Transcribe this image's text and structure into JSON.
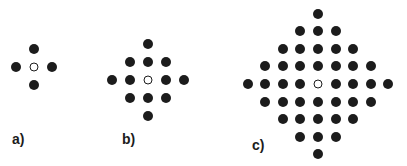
{
  "figure": {
    "panels": [
      {
        "id": "a",
        "label": "a)",
        "center": [
          34,
          67
        ],
        "spacing": 18,
        "radius": 1,
        "label_pos": [
          12,
          131
        ]
      },
      {
        "id": "b",
        "label": "b)",
        "center": [
          148,
          80
        ],
        "spacing": 18,
        "radius": 2,
        "label_pos": [
          122,
          131
        ]
      },
      {
        "id": "c",
        "label": "c)",
        "center": [
          318,
          84
        ],
        "spacing": 17.6,
        "radius": 4,
        "label_pos": [
          252,
          137
        ]
      }
    ],
    "dot_color": "#1c1c1c"
  }
}
